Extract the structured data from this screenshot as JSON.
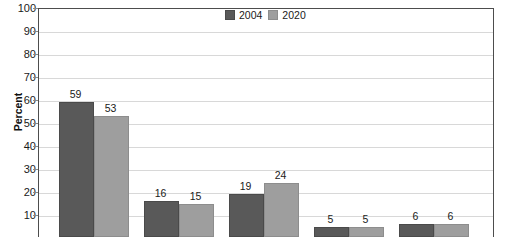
{
  "chart_data": {
    "type": "bar",
    "title": "",
    "xlabel": "",
    "ylabel": "Percent",
    "ylim": [
      0,
      100
    ],
    "ytick_labels": [
      "100",
      "90",
      "80",
      "70",
      "60",
      "50",
      "40",
      "30",
      "20",
      "10"
    ],
    "ytick_values": [
      100,
      90,
      80,
      70,
      60,
      50,
      40,
      30,
      20,
      10
    ],
    "grid": true,
    "legend_position": "top-center",
    "categories": [
      "",
      "",
      "",
      "",
      ""
    ],
    "series": [
      {
        "name": "2004",
        "color": "#595959",
        "values": [
          59,
          16,
          19,
          5,
          6
        ],
        "labels": [
          "59",
          "16",
          "19",
          "5",
          "6"
        ]
      },
      {
        "name": "2020",
        "color": "#9e9e9e",
        "values": [
          53,
          15,
          24,
          5,
          6
        ],
        "labels": [
          "53",
          "15",
          "24",
          "5",
          "6"
        ]
      }
    ],
    "note": "Image is cropped at the bottom; x-axis category labels and the lowest bars are not visible."
  },
  "legend": {
    "items": [
      {
        "label": "2004",
        "swatch": "legend-swatch-2004"
      },
      {
        "label": "2020",
        "swatch": "legend-swatch-2020"
      }
    ]
  },
  "axis": {
    "y_label": "Percent"
  }
}
